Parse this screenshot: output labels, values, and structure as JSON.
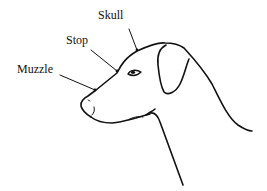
{
  "diagram": {
    "labels": {
      "skull": "Skull",
      "stop": "Stop",
      "muzzle": "Muzzle"
    },
    "colors": {
      "ink": "#111111",
      "background": "#ffffff"
    }
  }
}
